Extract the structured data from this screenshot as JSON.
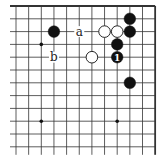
{
  "diagram": {
    "type": "go-board-fragment",
    "corner": "top-right",
    "columns": 12,
    "rows": 12,
    "origin": {
      "x": 16,
      "y": 6
    },
    "spacing": {
      "x": 12.65,
      "y": 12.8
    },
    "edges": {
      "top": true,
      "right": true,
      "left": false,
      "bottom": false
    },
    "colors": {
      "line": "#333333",
      "black_stone": "#111111",
      "white_stone": "#ffffff",
      "background": "#ffffff"
    },
    "star_points": [
      {
        "col": 2,
        "row": 3
      },
      {
        "col": 2,
        "row": 9
      },
      {
        "col": 8,
        "row": 9
      }
    ],
    "stones": [
      {
        "color": "black",
        "col": 3,
        "row": 2,
        "label": ""
      },
      {
        "color": "white",
        "col": 7,
        "row": 2,
        "label": ""
      },
      {
        "color": "white",
        "col": 8,
        "row": 2,
        "label": ""
      },
      {
        "color": "black",
        "col": 9,
        "row": 1,
        "label": ""
      },
      {
        "color": "black",
        "col": 9,
        "row": 2,
        "label": ""
      },
      {
        "color": "black",
        "col": 8,
        "row": 3,
        "label": ""
      },
      {
        "color": "black",
        "col": 8,
        "row": 4,
        "label": "1"
      },
      {
        "color": "white",
        "col": 6,
        "row": 4,
        "label": ""
      },
      {
        "color": "black",
        "col": 9,
        "row": 6,
        "label": ""
      }
    ],
    "labels": [
      {
        "text": "a",
        "col": 5,
        "row": 2
      },
      {
        "text": "b",
        "col": 3,
        "row": 4
      }
    ]
  }
}
